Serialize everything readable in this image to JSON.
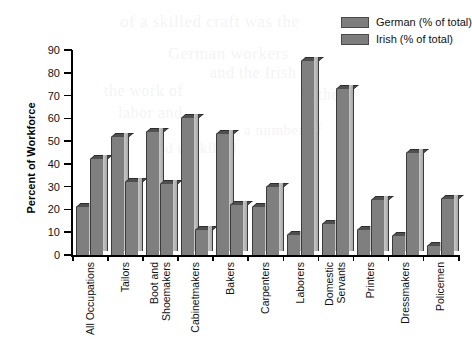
{
  "chart_data": {
    "type": "bar",
    "title": "",
    "xlabel": "",
    "ylabel": "Percent of Workforce",
    "ylim": [
      0,
      90
    ],
    "yticks": [
      0,
      10,
      20,
      30,
      40,
      50,
      60,
      70,
      80,
      90
    ],
    "grid": false,
    "legend_position": "top-right",
    "categories": [
      "All Occupations",
      "Tailors",
      "Boot and Shoemakers",
      "Cabinetmakers",
      "Bakers",
      "Carpenters",
      "Laborers",
      "Domestic Servants",
      "Printers",
      "Dressmakers",
      "Policemen"
    ],
    "category_lines": [
      [
        "All Occupations"
      ],
      [
        "Tailors"
      ],
      [
        "Boot and",
        "Shoemakers"
      ],
      [
        "Cabinetmakers"
      ],
      [
        "Bakers"
      ],
      [
        "Carpenters"
      ],
      [
        "Laborers"
      ],
      [
        "Domestic",
        "Servants"
      ],
      [
        "Printers"
      ],
      [
        "Dressmakers"
      ],
      [
        "Policemen"
      ]
    ],
    "series": [
      {
        "name": "German (% of total)",
        "color": "#7f7f7f",
        "values": [
          21,
          52,
          54,
          60,
          53,
          21,
          9,
          13.5,
          11,
          8.5,
          4
        ]
      },
      {
        "name": "Irish (% of total)",
        "color": "#7f7f7f",
        "values": [
          42,
          32,
          31,
          11,
          22,
          30,
          85,
          73,
          24,
          45,
          24.5
        ]
      }
    ]
  },
  "legend": {
    "items": [
      {
        "label": "German (% of total)",
        "swatch": "gray-swatch-icon"
      },
      {
        "label": "Irish (% of total)",
        "swatch": "gray-swatch-icon"
      }
    ]
  },
  "axes": {
    "y_title": "Percent of Workforce"
  },
  "ghost_text": [
    "of a skilled craft was the",
    "German workers",
    "and the Irish",
    "the work of",
    "labor and",
    "in the",
    "a number of",
    "and unskilled"
  ]
}
